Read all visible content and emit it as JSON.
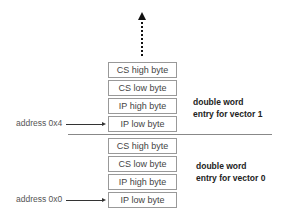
{
  "diagram": {
    "type": "interrupt-vector-table-memory-layout",
    "continuation_arrow": "dotted-up-arrow",
    "vectors": [
      {
        "label_line1": "double word",
        "label_line2": "entry for vector 1",
        "address": "address 0x4",
        "bytes": [
          "CS high byte",
          "CS low byte",
          "IP high byte",
          "IP low byte"
        ]
      },
      {
        "label_line1": "double word",
        "label_line2": "entry for vector 0",
        "address": "address 0x0",
        "bytes": [
          "CS high byte",
          "CS low byte",
          "IP high byte",
          "IP low byte"
        ]
      }
    ]
  }
}
